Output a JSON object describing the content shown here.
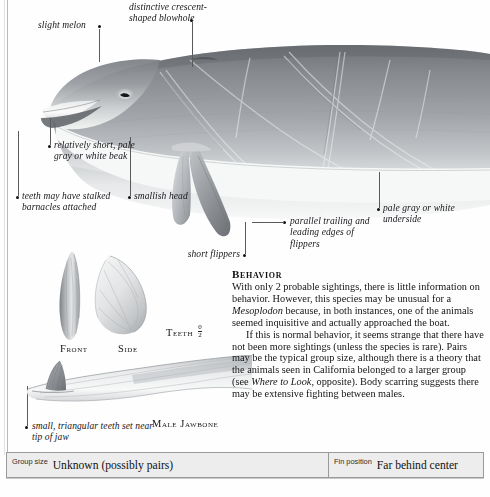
{
  "plate": {
    "title": "Mesoplodon species identification plate"
  },
  "callouts": [
    {
      "name": "slight-melon",
      "text": "slight melon"
    },
    {
      "name": "blowhole",
      "text": "distinctive crescent-shaped blowhole"
    },
    {
      "name": "beak",
      "text": "relatively short, pale gray or white beak"
    },
    {
      "name": "barnacles",
      "text": "teeth may have stalked barnacles attached"
    },
    {
      "name": "smallish-head",
      "text": "smallish head"
    },
    {
      "name": "short-flippers",
      "text": "short flippers"
    },
    {
      "name": "flipper-edges",
      "text": "parallel trailing and leading edges of flippers"
    },
    {
      "name": "underside",
      "text": "pale gray or white underside"
    },
    {
      "name": "small-teeth",
      "text": "small, triangular teeth set near tip of jaw"
    }
  ],
  "captions": {
    "front": "Front",
    "side": "Side",
    "teeth": "Teeth",
    "teeth_count_numerator": "0",
    "teeth_count_denominator": "2",
    "jawbone": "Male Jawbone"
  },
  "behavior": {
    "heading": "Behavior",
    "paragraph_1_a": "With only 2 probable sightings, there is little information on behavior. However, this species may be unusual for a ",
    "paragraph_1_italic": "Mesoplodon",
    "paragraph_1_b": " because, in both instances, one of the animals seemed inquisitive and actually approached the boat.",
    "paragraph_2_a": "If this is normal behavior, it seems strange that there have not been more sightings (unless the species is rare). Pairs may be the typical group size, although there is a theory that the animals seen in California belonged to a larger group (see ",
    "paragraph_2_italic": "Where to Look",
    "paragraph_2_b": ", opposite). Body scarring suggests there may be extensive fighting between males."
  },
  "footer": {
    "group_size_key": "Group size",
    "group_size_value": "Unknown (possibly pairs)",
    "fin_position_key": "Fin position",
    "fin_position_value": "Far behind center"
  },
  "colors": {
    "body_dark": "#8d9094",
    "body_mid": "#a9acb0",
    "body_light": "#d9dbdd",
    "underside": "#f2f3f4",
    "bar_fill": "#ededed",
    "bar_border": "#9a9a9a",
    "leader": "#5a5a5a",
    "ink": "#141414"
  }
}
